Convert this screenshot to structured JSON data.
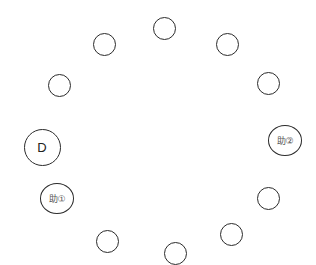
{
  "diagram": {
    "type": "seating-circle",
    "colors": {
      "stroke": "#2b2b2b",
      "background": "#ffffff",
      "label": "#333333"
    },
    "seats": [
      {
        "id": "seat-top",
        "label": "",
        "cx": 164,
        "cy": 28,
        "kind": "small"
      },
      {
        "id": "seat-upper-right",
        "label": "",
        "cx": 227,
        "cy": 44,
        "kind": "small"
      },
      {
        "id": "seat-right-upper",
        "label": "",
        "cx": 268,
        "cy": 83,
        "kind": "small"
      },
      {
        "id": "seat-assist-2",
        "label": "助②",
        "cx": 285,
        "cy": 140,
        "kind": "assist"
      },
      {
        "id": "seat-right-lower",
        "label": "",
        "cx": 268,
        "cy": 198,
        "kind": "small"
      },
      {
        "id": "seat-lower-right",
        "label": "",
        "cx": 231,
        "cy": 234,
        "kind": "small"
      },
      {
        "id": "seat-bottom",
        "label": "",
        "cx": 175,
        "cy": 253,
        "kind": "small"
      },
      {
        "id": "seat-lower-left",
        "label": "",
        "cx": 107,
        "cy": 241,
        "kind": "small"
      },
      {
        "id": "seat-assist-1",
        "label": "助①",
        "cx": 57,
        "cy": 198,
        "kind": "assist"
      },
      {
        "id": "seat-dealer",
        "label": "D",
        "cx": 42,
        "cy": 147,
        "kind": "dealer"
      },
      {
        "id": "seat-left-upper",
        "label": "",
        "cx": 59,
        "cy": 85,
        "kind": "small"
      },
      {
        "id": "seat-upper-left",
        "label": "",
        "cx": 104,
        "cy": 44,
        "kind": "small"
      }
    ]
  }
}
